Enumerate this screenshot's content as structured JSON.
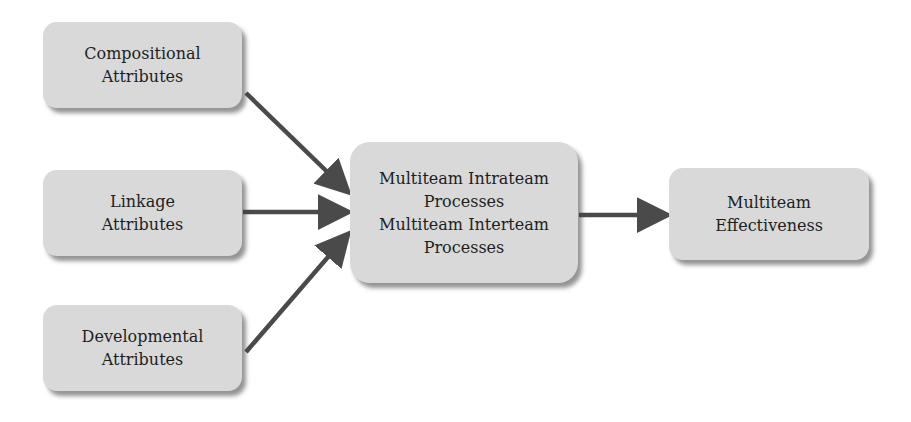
{
  "diagram": {
    "nodes": {
      "compositional": {
        "lines": [
          "Compositional",
          "Attributes"
        ]
      },
      "linkage": {
        "lines": [
          "Linkage",
          "Attributes"
        ]
      },
      "developmental": {
        "lines": [
          "Developmental",
          "Attributes"
        ]
      },
      "processes": {
        "lines": [
          "Multiteam Intrateam",
          "Processes",
          "Multiteam Interteam",
          "Processes"
        ]
      },
      "effectiveness": {
        "lines": [
          "Multiteam",
          "Effectiveness"
        ]
      }
    },
    "edges": [
      {
        "from": "Compositional Attributes",
        "to": "Multiteam Processes"
      },
      {
        "from": "Linkage Attributes",
        "to": "Multiteam Processes"
      },
      {
        "from": "Developmental Attributes",
        "to": "Multiteam Processes"
      },
      {
        "from": "Multiteam Processes",
        "to": "Multiteam Effectiveness"
      }
    ],
    "colors": {
      "box_fill": "#d9d9d9",
      "arrow": "#4a4a4a",
      "text": "#1e1e1e"
    }
  }
}
